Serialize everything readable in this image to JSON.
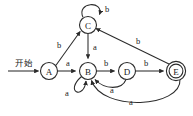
{
  "diagram": {
    "type": "finite-state-machine",
    "background_color": "#ffffff",
    "stroke_color": "#2b2b2b",
    "start_marker": {
      "label": "开始",
      "target": "A"
    },
    "alphabet": [
      "a",
      "b"
    ],
    "nodes": [
      {
        "id": "A",
        "label": "A",
        "x": 49,
        "y": 71,
        "r": 8.5,
        "accepting": false,
        "start": true
      },
      {
        "id": "B",
        "label": "B",
        "x": 88,
        "y": 71,
        "r": 8.5,
        "accepting": false,
        "start": false
      },
      {
        "id": "C",
        "label": "C",
        "x": 88,
        "y": 25,
        "r": 8.5,
        "accepting": false,
        "start": false
      },
      {
        "id": "D",
        "label": "D",
        "x": 127,
        "y": 71,
        "r": 8.5,
        "accepting": false,
        "start": false
      },
      {
        "id": "E",
        "label": "E",
        "x": 176,
        "y": 71,
        "r": 8.5,
        "accepting": true,
        "start": false
      }
    ],
    "edges": [
      {
        "from": "A",
        "to": "B",
        "label": "a",
        "label_x": 68,
        "label_y": 63,
        "kind": "straight"
      },
      {
        "from": "A",
        "to": "C",
        "label": "b",
        "label_x": 59,
        "label_y": 45,
        "kind": "straight"
      },
      {
        "from": "C",
        "to": "C",
        "label": "b",
        "label_x": 105,
        "label_y": 9,
        "kind": "self-loop-top"
      },
      {
        "from": "C",
        "to": "B",
        "label": "a",
        "label_x": 95,
        "label_y": 49,
        "kind": "straight"
      },
      {
        "from": "B",
        "to": "B",
        "label": "a",
        "label_x": 68,
        "label_y": 93,
        "kind": "self-loop-bottom"
      },
      {
        "from": "B",
        "to": "D",
        "label": "b",
        "label_x": 107,
        "label_y": 63,
        "kind": "straight"
      },
      {
        "from": "D",
        "to": "E",
        "label": "b",
        "label_x": 144,
        "label_y": 63,
        "kind": "straight"
      },
      {
        "from": "D",
        "to": "B",
        "label": "a",
        "label_x": 112,
        "label_y": 90,
        "kind": "curve"
      },
      {
        "from": "E",
        "to": "C",
        "label": "b",
        "label_x": 138,
        "label_y": 41,
        "kind": "straight"
      },
      {
        "from": "E",
        "to": "B",
        "label": "a",
        "label_x": 130,
        "label_y": 103,
        "kind": "curve"
      }
    ]
  }
}
